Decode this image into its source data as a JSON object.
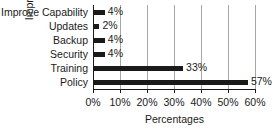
{
  "chart_data": {
    "type": "bar",
    "orientation": "horizontal",
    "title": "",
    "xlabel": "Percentages",
    "ylabel": "Improvements",
    "categories": [
      "Improve Capability",
      "Updates",
      "Backup",
      "Security",
      "Training",
      "Policy"
    ],
    "values": [
      4,
      2,
      4,
      4,
      33,
      57
    ],
    "value_labels": [
      "4%",
      "2%",
      "4%",
      "4%",
      "33%",
      "57%"
    ],
    "xlim": [
      0,
      60
    ],
    "xticks": [
      0,
      10,
      20,
      30,
      40,
      50,
      60
    ],
    "xtick_labels": [
      "0%",
      "10%",
      "20%",
      "30%",
      "40%",
      "50%",
      "60%"
    ],
    "grid": "vertical",
    "legend": "none",
    "bar_color": "#1a1a1a",
    "gridline_color": "#a6a6a6",
    "axis_color": "#1a1a1a",
    "background_color": "#ffffff"
  }
}
